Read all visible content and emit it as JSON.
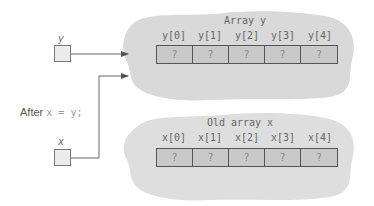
{
  "variables": {
    "y": {
      "label": "y"
    },
    "x": {
      "label": "x"
    }
  },
  "statement": {
    "prefix": "After",
    "code": "x = y;"
  },
  "arrays": [
    {
      "title": "Array y",
      "indices": [
        "y[0]",
        "y[1]",
        "y[2]",
        "y[3]",
        "y[4]"
      ],
      "values": [
        "?",
        "?",
        "?",
        "?",
        "?"
      ]
    },
    {
      "title": "Old array x",
      "indices": [
        "x[0]",
        "x[1]",
        "x[2]",
        "x[3]",
        "x[4]"
      ],
      "values": [
        "?",
        "?",
        "?",
        "?",
        "?"
      ]
    }
  ],
  "colors": {
    "cloud": "#d9d9d9",
    "cell_fill": "#c9c9c9",
    "var_box_fill": "#ececec",
    "line": "#666666"
  }
}
